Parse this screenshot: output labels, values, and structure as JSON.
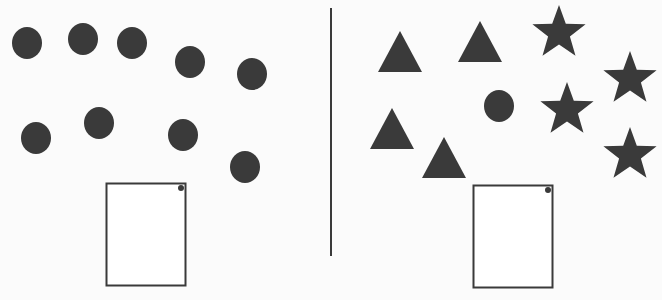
{
  "worksheet": {
    "description": "Shape counting worksheet: two groups separated by a vertical line, each with an empty answer box",
    "colors": {
      "shape_fill": "#3a3a3a",
      "line": "#3a3a3a",
      "background": "#fbfbfb"
    },
    "left_group": {
      "shapes": [
        {
          "type": "circle"
        },
        {
          "type": "circle"
        },
        {
          "type": "circle"
        },
        {
          "type": "circle"
        },
        {
          "type": "circle"
        },
        {
          "type": "circle"
        },
        {
          "type": "circle"
        },
        {
          "type": "circle"
        },
        {
          "type": "circle"
        }
      ],
      "answer_box": {
        "value": ""
      }
    },
    "right_group": {
      "shapes": [
        {
          "type": "triangle"
        },
        {
          "type": "triangle"
        },
        {
          "type": "triangle"
        },
        {
          "type": "triangle"
        },
        {
          "type": "circle"
        },
        {
          "type": "star"
        },
        {
          "type": "star"
        },
        {
          "type": "star"
        },
        {
          "type": "star"
        }
      ],
      "answer_box": {
        "value": ""
      }
    }
  }
}
